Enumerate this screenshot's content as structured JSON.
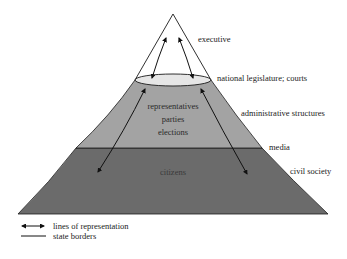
{
  "diagram": {
    "type": "pyramid",
    "colors": {
      "top_fill": "#ffffff",
      "ellipse_fill": "#e6e6e6",
      "middle_fill": "#a3a3a3",
      "bottom_fill": "#6b6b6b",
      "outline": "#1a1a1a"
    },
    "levels": {
      "top": "executive",
      "ellipse": "national legislature; courts",
      "middle_outside": "administrative structures",
      "boundary": "media",
      "bottom_outside": "civil society"
    },
    "inner_labels": {
      "middle": [
        "representatives",
        "parties",
        "elections"
      ],
      "bottom": "citizens"
    },
    "legend": [
      {
        "symbol": "double-arrow",
        "label": "lines of representation"
      },
      {
        "symbol": "line",
        "label": "state borders"
      }
    ]
  }
}
